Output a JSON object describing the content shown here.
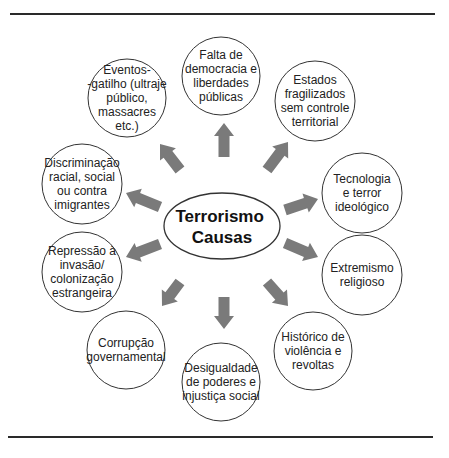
{
  "diagram": {
    "center": {
      "lines": [
        "Terrorismo",
        "Causas"
      ],
      "cx": 222,
      "cy": 226,
      "rx": 58,
      "ry": 33
    },
    "nodes": [
      {
        "id": "falta-democracia",
        "lines": [
          "Falta de",
          "democracia e",
          "liberdades",
          "públicas"
        ],
        "cx": 221,
        "cy": 76,
        "r": 39
      },
      {
        "id": "estados-fragilizados",
        "lines": [
          "Estados",
          "fragilizados",
          "sem controle",
          "territorial"
        ],
        "cx": 315,
        "cy": 101,
        "r": 40
      },
      {
        "id": "tecnologia-terror",
        "lines": [
          "Tecnologia",
          "e terror",
          "ideológico"
        ],
        "cx": 362,
        "cy": 193,
        "r": 40
      },
      {
        "id": "extremismo-religioso",
        "lines": [
          "Extremismo",
          "religioso"
        ],
        "cx": 362,
        "cy": 275,
        "r": 40
      },
      {
        "id": "historico-violencia",
        "lines": [
          "Histórico de",
          "violência e",
          "revoltas"
        ],
        "cx": 313,
        "cy": 351,
        "r": 39
      },
      {
        "id": "desigualdade-poderes",
        "lines": [
          "Desigualdade",
          "de poderes e",
          "injustiça social"
        ],
        "cx": 221,
        "cy": 382,
        "r": 39
      },
      {
        "id": "corrupcao-governamental",
        "lines": [
          "Corrupção",
          "governamental"
        ],
        "cx": 126,
        "cy": 350,
        "r": 39
      },
      {
        "id": "repressao-invasao",
        "lines": [
          "Repressão à",
          "invasão/",
          "colonização",
          "estrangeira"
        ],
        "cx": 82,
        "cy": 272,
        "r": 40
      },
      {
        "id": "discriminacao",
        "lines": [
          "Discriminação",
          "racial, social",
          "ou contra",
          "imigrantes"
        ],
        "cx": 82,
        "cy": 184,
        "r": 40
      },
      {
        "id": "eventos-gatilho",
        "lines": [
          "Eventos-",
          "-gatilho (ultraje",
          "público,",
          "massacres",
          "etc.)"
        ],
        "cx": 127,
        "cy": 98,
        "r": 39
      }
    ],
    "arrows": [
      {
        "to": "falta-democracia",
        "x1": 224,
        "y1": 157,
        "x2": 224,
        "y2": 123
      },
      {
        "to": "estados-fragilizados",
        "x1": 267,
        "y1": 170,
        "x2": 288,
        "y2": 142
      },
      {
        "to": "tecnologia-terror",
        "x1": 285,
        "y1": 210,
        "x2": 318,
        "y2": 199
      },
      {
        "to": "extremismo-religioso",
        "x1": 285,
        "y1": 243,
        "x2": 318,
        "y2": 257
      },
      {
        "to": "historico-violencia",
        "x1": 267,
        "y1": 282,
        "x2": 288,
        "y2": 306
      },
      {
        "to": "desigualdade-poderes",
        "x1": 224,
        "y1": 297,
        "x2": 224,
        "y2": 329
      },
      {
        "to": "corrupcao-governamental",
        "x1": 180,
        "y1": 282,
        "x2": 162,
        "y2": 306
      },
      {
        "to": "repressao-invasao",
        "x1": 160,
        "y1": 244,
        "x2": 126,
        "y2": 257
      },
      {
        "to": "discriminacao",
        "x1": 160,
        "y1": 207,
        "x2": 126,
        "y2": 193
      },
      {
        "to": "eventos-gatilho",
        "x1": 180,
        "y1": 170,
        "x2": 160,
        "y2": 144
      }
    ]
  },
  "colors": {
    "arrow": "#7a7a7a",
    "stroke": "#333333",
    "text": "#222222",
    "rule": "#2a2a2a"
  },
  "rules": {
    "top": {
      "y": 14,
      "x1": 10,
      "x2": 435
    },
    "bottom": {
      "y": 437,
      "x1": 8,
      "x2": 433
    }
  }
}
